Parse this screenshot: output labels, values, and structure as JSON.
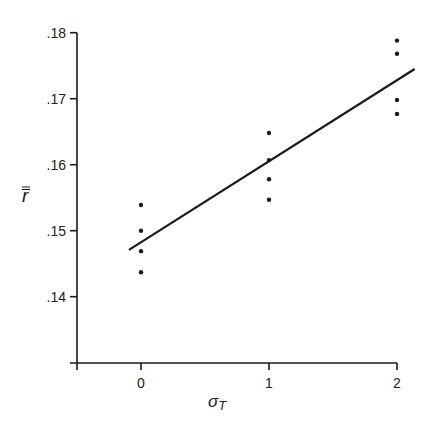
{
  "chart_data": {
    "type": "scatter",
    "title": "",
    "xlabel": "σT",
    "xlabel_main": "σ",
    "xlabel_sub": "T",
    "ylabel": "r̿",
    "ylabel_main": "r",
    "xlim": [
      -0.5,
      2.1
    ],
    "ylim": [
      0.135,
      0.18
    ],
    "x_ticks": [
      0,
      1,
      2
    ],
    "x_tick_labels": [
      "0",
      "1",
      "2"
    ],
    "y_ticks": [
      0.14,
      0.15,
      0.16,
      0.17,
      0.18
    ],
    "y_tick_labels": [
      ".14",
      ".15",
      ".16",
      ".17",
      ".18"
    ],
    "grid": false,
    "legend": null,
    "series": [
      {
        "name": "observations",
        "kind": "points",
        "points": [
          {
            "x": 0,
            "y": 0.1539
          },
          {
            "x": 0,
            "y": 0.15
          },
          {
            "x": 0,
            "y": 0.1469
          },
          {
            "x": 0,
            "y": 0.1437
          },
          {
            "x": 1,
            "y": 0.1648
          },
          {
            "x": 1,
            "y": 0.1607
          },
          {
            "x": 1,
            "y": 0.1578
          },
          {
            "x": 1,
            "y": 0.1547
          },
          {
            "x": 2,
            "y": 0.1788
          },
          {
            "x": 2,
            "y": 0.1768
          },
          {
            "x": 2,
            "y": 0.1698
          },
          {
            "x": 2,
            "y": 0.1677
          }
        ]
      },
      {
        "name": "fitted line",
        "kind": "line",
        "points": [
          {
            "x": -0.094,
            "y": 0.1471
          },
          {
            "x": 2.138,
            "y": 0.1745
          }
        ]
      }
    ]
  },
  "colors": {
    "ink": "#1a1a1a",
    "background": "#ffffff"
  }
}
